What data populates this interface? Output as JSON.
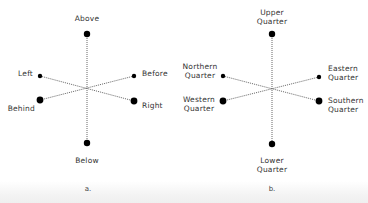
{
  "colors": {
    "dot": "#000000",
    "line": "#555555",
    "text": "#333333",
    "background": "#ffffff"
  },
  "diagrams": [
    {
      "id": "a",
      "caption": "a.",
      "center": [
        87,
        88
      ],
      "labels": {
        "top": "Above",
        "bottom": "Below",
        "upper_left": "Left",
        "lower_left": "Behind",
        "upper_right": "Before",
        "lower_right": "Right"
      },
      "nodes": {
        "top": {
          "x": 87,
          "y": 34,
          "r": 3.2
        },
        "bottom": {
          "x": 87,
          "y": 143,
          "r": 3.2
        },
        "upper_left": {
          "x": 40,
          "y": 76,
          "r": 2.2
        },
        "lower_left": {
          "x": 40,
          "y": 100,
          "r": 3.4
        },
        "upper_right": {
          "x": 134,
          "y": 76,
          "r": 2.2
        },
        "lower_right": {
          "x": 134,
          "y": 101,
          "r": 3.4
        }
      }
    },
    {
      "id": "b",
      "caption": "b.",
      "center": [
        272,
        89
      ],
      "labels": {
        "top": [
          "Upper",
          "Quarter"
        ],
        "bottom": [
          "Lower",
          "Quarter"
        ],
        "upper_left": [
          "Northern",
          "Quarter"
        ],
        "lower_left": [
          "Western",
          "Quarter"
        ],
        "upper_right": [
          "Eastern",
          "Quarter"
        ],
        "lower_right": [
          "Southern",
          "Quarter"
        ]
      },
      "nodes": {
        "top": {
          "x": 272,
          "y": 34,
          "r": 3.2
        },
        "bottom": {
          "x": 272,
          "y": 144,
          "r": 3.2
        },
        "upper_left": {
          "x": 223,
          "y": 76,
          "r": 2.2
        },
        "lower_left": {
          "x": 223,
          "y": 101,
          "r": 3.4
        },
        "upper_right": {
          "x": 319,
          "y": 77,
          "r": 2.2
        },
        "lower_right": {
          "x": 319,
          "y": 101,
          "r": 3.4
        }
      }
    }
  ]
}
